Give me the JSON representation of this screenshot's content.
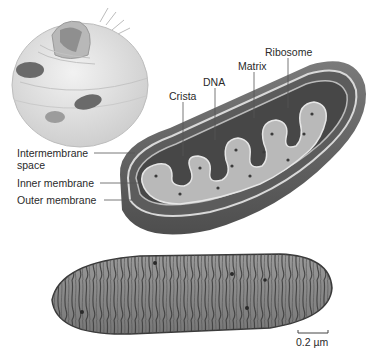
{
  "diagram": {
    "panels": [
      {
        "name": "cell-cutaway",
        "description": "Cutaway of a eukaryotic cell showing mitochondria"
      },
      {
        "name": "mitochondrion-3d-cutaway",
        "description": "Cutaway illustration of a mitochondrion with cristae"
      },
      {
        "name": "electron-micrograph",
        "description": "Transmission electron micrograph of a mitochondrion"
      }
    ],
    "labels": {
      "ribosome": "Ribosome",
      "matrix": "Matrix",
      "dna": "DNA",
      "crista": "Crista",
      "intermembrane_line1": "Intermembrane",
      "intermembrane_line2": "space",
      "inner_membrane": "Inner membrane",
      "outer_membrane": "Outer  membrane"
    },
    "scale_bar": {
      "label": "0.2 µm"
    },
    "colors": {
      "background": "#ffffff",
      "outer_shell": "#6e6e6e",
      "inner_dark": "#4a4a4a",
      "cristae": "#b9b9b9",
      "micrograph": "#8a8a8a",
      "label_text": "#2a2a2a",
      "leader_line": "#555555"
    }
  }
}
